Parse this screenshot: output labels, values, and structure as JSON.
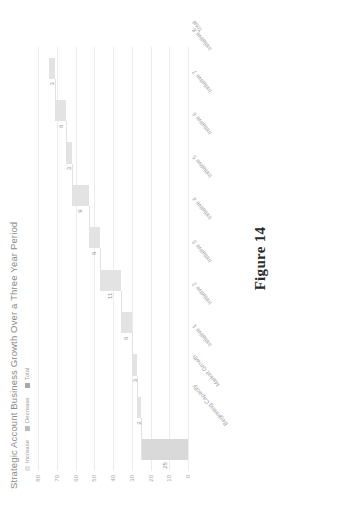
{
  "figure": {
    "caption": "Figure 14"
  },
  "chart": {
    "title": "Strategic Account Business Growth Over a Three Year Period",
    "legend": [
      {
        "label": "Increase",
        "color": "#e3e3e3"
      },
      {
        "label": "Decrease",
        "color": "#bdbdbd"
      },
      {
        "label": "Total",
        "color": "#a8a8a8"
      }
    ]
  },
  "chart_data": {
    "type": "bar",
    "subtype": "waterfall",
    "title": "Strategic Account Business Growth Over a Three Year Period",
    "xlabel": "",
    "ylabel": "",
    "ylim": [
      0,
      80
    ],
    "yticks": [
      0,
      10,
      20,
      30,
      40,
      50,
      60,
      70,
      80
    ],
    "ytick_labels": [
      "0",
      "10",
      "20",
      "30",
      "40",
      "50",
      "60",
      "70",
      "80"
    ],
    "grid": true,
    "legend_position": "top-left",
    "categories": [
      "Beginning Capacity",
      "Market Growth",
      "Initiative 1",
      "Initiative 2",
      "Initiative 3",
      "Initiative 4",
      "Initiative 5",
      "Initiative 6",
      "Initiative 7",
      "Initiative 8",
      "Total"
    ],
    "values": [
      25,
      2,
      3,
      6,
      11,
      6,
      9,
      3,
      6,
      3,
      74
    ],
    "bar_types": [
      "total",
      "increase",
      "increase",
      "increase",
      "increase",
      "increase",
      "increase",
      "increase",
      "increase",
      "increase",
      "total"
    ],
    "bar_bases": [
      0,
      25,
      27,
      30,
      36,
      47,
      53,
      62,
      65,
      71,
      0
    ],
    "bar_labels": [
      "25",
      "2",
      "3",
      "6",
      "11",
      "6",
      "9",
      "3",
      "6",
      "3",
      ""
    ],
    "cumulative": [
      25,
      27,
      30,
      36,
      47,
      53,
      62,
      65,
      71,
      74,
      74
    ]
  }
}
